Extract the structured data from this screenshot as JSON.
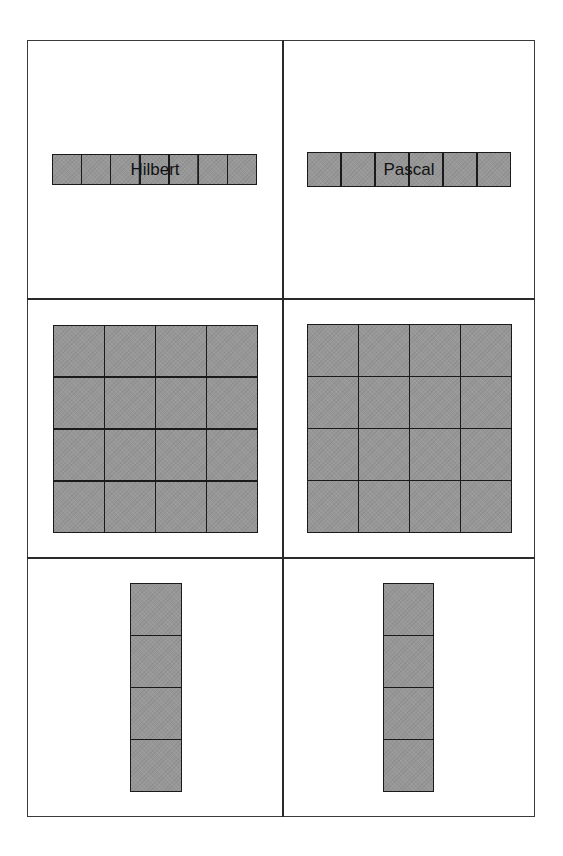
{
  "diagram": {
    "columns": [
      {
        "label": "Hilbert"
      },
      {
        "label": "Pascal"
      }
    ],
    "rows": [
      {
        "panels": [
          {
            "shape": [
              1,
              7
            ],
            "label": "Hilbert"
          },
          {
            "shape": [
              1,
              6
            ],
            "label": "Pascal"
          }
        ]
      },
      {
        "panels": [
          {
            "shape": [
              4,
              4
            ]
          },
          {
            "shape": [
              4,
              4
            ]
          }
        ]
      },
      {
        "panels": [
          {
            "shape": [
              4,
              1
            ]
          },
          {
            "shape": [
              4,
              1
            ]
          }
        ]
      }
    ],
    "colors": {
      "cell_fill": "#979797",
      "cell_border": "#1a1a1a",
      "frame": "#3a3a3a",
      "background": "#ffffff"
    }
  }
}
